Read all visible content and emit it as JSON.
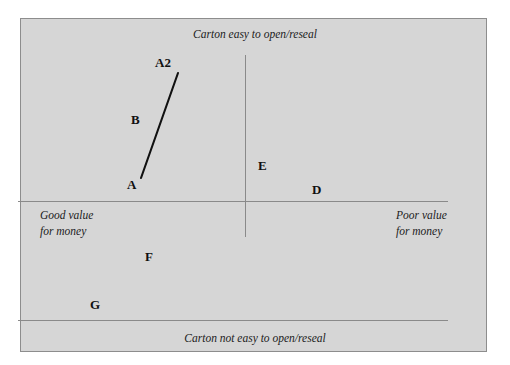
{
  "chart_data": {
    "type": "scatter",
    "title": "",
    "xlabel": "Value for money",
    "ylabel": "Carton ease of opening/resealing",
    "axes": {
      "top_label": "Carton easy to open/reseal",
      "bottom_label": "Carton not easy to open/reseal",
      "left_label_line1": "Good value",
      "left_label_line2": "for money",
      "right_label_line1": "Poor value",
      "right_label_line2": "for money"
    },
    "xlim": [
      -1,
      1
    ],
    "ylim": [
      -1,
      1
    ],
    "grid": false,
    "legend": "none",
    "brands": [
      {
        "label": "A2",
        "x": 0.34,
        "y": 0.66,
        "quadrant": "good-value/easy-open"
      },
      {
        "label": "B",
        "x": 0.26,
        "y": 0.37,
        "quadrant": "good-value/easy-open"
      },
      {
        "label": "A",
        "x": 0.24,
        "y": 0.08,
        "quadrant": "good-value/easy-open"
      },
      {
        "label": "E",
        "x": 0.56,
        "y": 0.13,
        "quadrant": "poor-value/easy-open"
      },
      {
        "label": "D",
        "x": 0.68,
        "y": 0.05,
        "quadrant": "poor-value/easy-open"
      },
      {
        "label": "F",
        "x": 0.31,
        "y": -0.2,
        "quadrant": "good-value/not-easy-open"
      },
      {
        "label": "G",
        "x": 0.18,
        "y": -0.43,
        "quadrant": "good-value/not-easy-open"
      }
    ],
    "movement_arrows": [
      {
        "from": "A",
        "to": "A2",
        "description": "repositioning line from A to A2"
      }
    ],
    "colors": {
      "panel_background": "#d6d6d6",
      "panel_border": "#8d8d8d",
      "axis_line": "#8a8a8a",
      "text": "#1c1c1c",
      "segment": "#111111"
    }
  },
  "brand_positions_px": {
    "A2": {
      "left": 155,
      "top": 55
    },
    "B": {
      "left": 131,
      "top": 112
    },
    "A": {
      "left": 127,
      "top": 177
    },
    "E": {
      "left": 258,
      "top": 158
    },
    "D": {
      "left": 312,
      "top": 182
    },
    "F": {
      "left": 145,
      "top": 249
    },
    "G": {
      "left": 90,
      "top": 297
    }
  },
  "segment_px": {
    "x1": 141,
    "y1": 178,
    "x2": 178,
    "y2": 73
  }
}
